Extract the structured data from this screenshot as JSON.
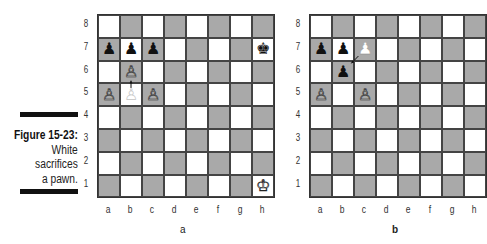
{
  "caption": {
    "figure_label": "Figure 15-23:",
    "lines": [
      "White",
      "sacrifices",
      "a pawn."
    ]
  },
  "files": [
    "a",
    "b",
    "c",
    "d",
    "e",
    "f",
    "g",
    "h"
  ],
  "ranks": [
    "8",
    "7",
    "6",
    "5",
    "4",
    "3",
    "2",
    "1"
  ],
  "diagrams": [
    {
      "label": "a",
      "pieces": [
        {
          "square": "a7",
          "piece": "black-pawn",
          "glyph": "♟"
        },
        {
          "square": "b7",
          "piece": "black-pawn",
          "glyph": "♟"
        },
        {
          "square": "c7",
          "piece": "black-pawn",
          "glyph": "♟"
        },
        {
          "square": "h7",
          "piece": "black-king",
          "glyph": "♚"
        },
        {
          "square": "b6",
          "piece": "white-pawn",
          "glyph": "♙"
        },
        {
          "square": "a5",
          "piece": "white-pawn",
          "glyph": "♙"
        },
        {
          "square": "b5",
          "piece": "white-pawn-ghost",
          "glyph": "♙"
        },
        {
          "square": "c5",
          "piece": "white-pawn",
          "glyph": "♙"
        },
        {
          "square": "h1",
          "piece": "white-king",
          "glyph": "♔"
        }
      ],
      "move_arrow": {
        "from": "b5",
        "to": "b6"
      }
    },
    {
      "label": "b",
      "pieces": [
        {
          "square": "a7",
          "piece": "black-pawn",
          "glyph": "♟"
        },
        {
          "square": "b7",
          "piece": "black-pawn",
          "glyph": "♟"
        },
        {
          "square": "c7",
          "piece": "black-pawn-ghost",
          "glyph": "♟"
        },
        {
          "square": "b6",
          "piece": "black-pawn",
          "glyph": "♟"
        },
        {
          "square": "a5",
          "piece": "white-pawn",
          "glyph": "♙"
        },
        {
          "square": "c5",
          "piece": "white-pawn",
          "glyph": "♙"
        }
      ],
      "move_arrow": {
        "from": "c7",
        "to": "b6"
      }
    }
  ]
}
